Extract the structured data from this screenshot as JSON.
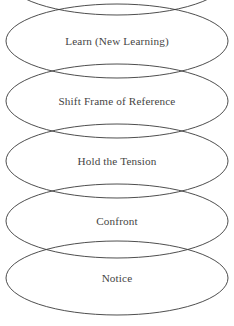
{
  "diagram": {
    "type": "stacked-ellipse-process-diagram",
    "orientation": "vertical",
    "reading_order": "bottom-to-top",
    "stroke_color": "#3a3a3a",
    "text_color": "#333333",
    "background_color": "#ffffff",
    "nodes": [
      {
        "id": "node-top-cutoff",
        "label": "",
        "truncated": true,
        "note": "topmost ellipse is cropped by the image edge; only its lower arc is visible and no text is shown",
        "cx": 117,
        "cy": -22,
        "rx": 111,
        "ry": 37
      },
      {
        "id": "node-learn",
        "label": "Learn (New Learning)",
        "truncated": false,
        "cx": 117,
        "cy": 41,
        "rx": 111,
        "ry": 37
      },
      {
        "id": "node-shift-frame",
        "label": "Shift Frame of Reference",
        "truncated": false,
        "cx": 117,
        "cy": 101,
        "rx": 111,
        "ry": 37
      },
      {
        "id": "node-hold-tension",
        "label": "Hold the Tension",
        "truncated": false,
        "cx": 117,
        "cy": 161,
        "rx": 111,
        "ry": 37
      },
      {
        "id": "node-confront",
        "label": "Confront",
        "truncated": false,
        "cx": 117,
        "cy": 221,
        "rx": 111,
        "ry": 37
      },
      {
        "id": "node-notice",
        "label": "Notice",
        "truncated": false,
        "cx": 117,
        "cy": 278,
        "rx": 111,
        "ry": 37
      }
    ]
  }
}
